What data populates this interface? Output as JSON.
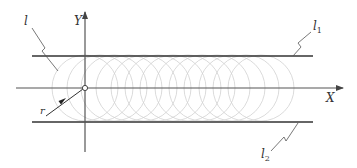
{
  "diagram": {
    "labels": {
      "l": "l",
      "y_axis": "Y",
      "l1_base": "l",
      "l1_sub": "1",
      "x_axis": "X",
      "r": "r",
      "l2_base": "l",
      "l2_sub": "2"
    },
    "colors": {
      "line": "#333333",
      "axis": "#555555",
      "circle": "#cfcfcf"
    },
    "geometry": {
      "origin": [
        85,
        88
      ],
      "x_axis": {
        "from": [
          16,
          88
        ],
        "to": [
          343,
          88
        ]
      },
      "y_axis": {
        "from": [
          85,
          152
        ],
        "to": [
          85,
          12
        ]
      },
      "l1": {
        "from": [
          32,
          56
        ],
        "to": [
          313,
          56
        ]
      },
      "l2": {
        "from": [
          32,
          122
        ],
        "to": [
          313,
          122
        ]
      },
      "circle_radius": 33,
      "circle_centers_x": [
        85,
        100,
        114,
        129,
        144,
        158,
        173,
        188,
        202,
        217,
        232,
        246,
        261
      ]
    }
  }
}
